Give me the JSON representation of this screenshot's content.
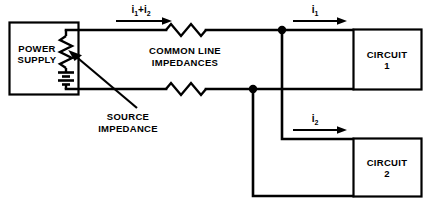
{
  "diagram": {
    "colors": {
      "line": "#000000",
      "background": "#ffffff"
    },
    "blocks": {
      "power_supply": {
        "line1": "POWER",
        "line2": "SUPPLY"
      },
      "circuit_1": {
        "line1": "CIRCUIT",
        "line2": "1"
      },
      "circuit_2": {
        "line1": "CIRCUIT",
        "line2": "2"
      }
    },
    "captions": {
      "common_line": {
        "line1": "COMMON LINE",
        "line2": "IMPEDANCES"
      },
      "source_impedance": {
        "line1": "SOURCE",
        "line2": "IMPEDANCE"
      }
    },
    "currents": {
      "total": {
        "symbol": "i",
        "sub1": "1",
        "plus": "+",
        "symbol2": "i",
        "sub2": "2"
      },
      "i1": {
        "symbol": "i",
        "sub": "1"
      },
      "i2": {
        "symbol": "i",
        "sub": "2"
      }
    },
    "components": {
      "source_impedance_symbol": "resistor",
      "battery_symbol": "battery",
      "line_impedance_top_symbol": "resistor",
      "line_impedance_bottom_symbol": "resistor"
    }
  }
}
